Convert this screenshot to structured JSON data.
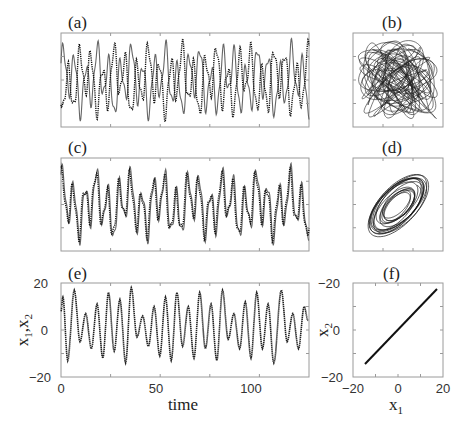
{
  "figure": {
    "panels": {
      "a": {
        "label": "(a)"
      },
      "b": {
        "label": "(b)"
      },
      "c": {
        "label": "(c)"
      },
      "d": {
        "label": "(d)"
      },
      "e": {
        "label": "(e)",
        "xlabel": "time",
        "ylabel": "x1,x2",
        "xticks": [
          "0",
          "50",
          "100"
        ],
        "yticks": [
          "20",
          "0",
          "−20"
        ]
      },
      "f": {
        "label": "(f)",
        "xlabel": "x1",
        "ylabel": "x2",
        "xticks": [
          "−20",
          "0",
          "20"
        ],
        "yticks": [
          "−20",
          "0",
          "−20"
        ]
      }
    }
  },
  "chart_data": [
    {
      "panel": "a",
      "type": "line",
      "title": "(a)",
      "description": "Two unsynchronized chaotic time series x1 (solid) and x2 (dotted)",
      "series": [
        {
          "name": "x1",
          "style": "solid"
        },
        {
          "name": "x2",
          "style": "dotted"
        }
      ],
      "grid": false,
      "ticks_labeled": false
    },
    {
      "panel": "b",
      "type": "scatter",
      "title": "(b)",
      "description": "Phase plot x2 vs x1, unsynchronized — filled square cloud",
      "grid": false,
      "ticks_labeled": false
    },
    {
      "panel": "c",
      "type": "line",
      "title": "(c)",
      "description": "Two partially synchronized chaotic time series x1 (solid) and x2 (dotted)",
      "series": [
        {
          "name": "x1",
          "style": "solid"
        },
        {
          "name": "x2",
          "style": "dotted"
        }
      ],
      "grid": false,
      "ticks_labeled": false
    },
    {
      "panel": "d",
      "type": "scatter",
      "title": "(d)",
      "description": "Phase plot x2 vs x1, partial synchronization — tilted elliptical band",
      "grid": false,
      "ticks_labeled": false
    },
    {
      "panel": "e",
      "type": "line",
      "title": "(e)",
      "xlabel": "time",
      "ylabel": "x1,x2",
      "xlim": [
        0,
        130
      ],
      "ylim": [
        -20,
        20
      ],
      "xticks": [
        0,
        50,
        100
      ],
      "yticks": [
        -20,
        0,
        20
      ],
      "series": [
        {
          "name": "x1 = x2 (synchronized)",
          "x": [
            0,
            1,
            3.5,
            7,
            10,
            13,
            16,
            19,
            22,
            25,
            28,
            31,
            34,
            37,
            40,
            43,
            46,
            49,
            52,
            55,
            58,
            61,
            64,
            67,
            70,
            73,
            76,
            79,
            82,
            85,
            88,
            91,
            94,
            97,
            100,
            103,
            106,
            109,
            112,
            116,
            119,
            122,
            125,
            128,
            130
          ],
          "y": [
            8,
            14,
            -13,
            17,
            -5,
            7,
            -8,
            11,
            -12,
            16,
            -9,
            13,
            -14,
            18,
            -3,
            6,
            -7,
            10,
            -11,
            14,
            -13,
            16,
            -7,
            10,
            -12,
            16,
            -8,
            11,
            -13,
            17,
            -4,
            7,
            -8,
            12,
            -12,
            16,
            -8,
            11,
            -14,
            17,
            -5,
            7,
            -8,
            10,
            4
          ]
        }
      ]
    },
    {
      "panel": "f",
      "type": "scatter",
      "title": "(f)",
      "xlabel": "x1",
      "ylabel": "x2",
      "xlim": [
        -20,
        20
      ],
      "ylim": [
        -20,
        20
      ],
      "xticks": [
        -20,
        0,
        20
      ],
      "yticks_labels": [
        "-20",
        "0",
        "-20"
      ],
      "description": "Phase plot x2 vs x1 in complete synchronization — diagonal line x2 = x1",
      "line": {
        "x": [
          -15,
          18
        ],
        "y": [
          -15,
          18
        ]
      }
    }
  ]
}
